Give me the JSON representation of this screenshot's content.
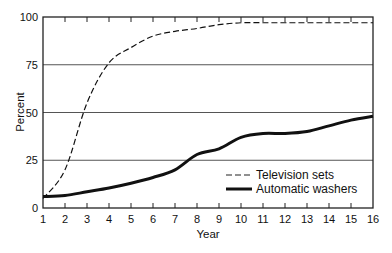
{
  "chart_data": {
    "type": "line",
    "title": "",
    "xlabel": "Year",
    "ylabel": "Percent",
    "x": [
      1,
      2,
      3,
      4,
      5,
      6,
      7,
      8,
      9,
      10,
      11,
      12,
      13,
      14,
      15,
      16
    ],
    "xticks": [
      "1",
      "2",
      "3",
      "4",
      "5",
      "6",
      "7",
      "8",
      "9",
      "10",
      "11",
      "12",
      "13",
      "14",
      "15",
      "16"
    ],
    "yticks": [
      "0",
      "25",
      "50",
      "75",
      "100"
    ],
    "xlim": [
      1,
      16
    ],
    "ylim": [
      0,
      100
    ],
    "grid": "horizontal at 25, 50, 75",
    "legend_position": "lower right, inside plot",
    "series": [
      {
        "name": "Television sets",
        "style": "dashed",
        "values": [
          5,
          20,
          55,
          76,
          84,
          90,
          92.5,
          94,
          96,
          97,
          97,
          97,
          97,
          97,
          97,
          97
        ]
      },
      {
        "name": "Automatic washers",
        "style": "solid-thick",
        "values": [
          6,
          6.5,
          8.5,
          10.5,
          13,
          16,
          20,
          28,
          31,
          37,
          39,
          39,
          40,
          43,
          46,
          48
        ]
      }
    ]
  },
  "colors": {
    "line": "#111111",
    "grid": "#555555",
    "background": "#ffffff"
  }
}
